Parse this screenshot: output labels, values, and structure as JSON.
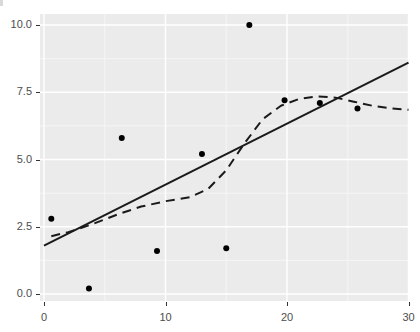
{
  "chart_data": {
    "type": "scatter",
    "title": "",
    "subtitle": "",
    "xlabel": "",
    "ylabel": "",
    "xlim": [
      -1.2,
      30.0
    ],
    "ylim": [
      -0.35,
      10.35
    ],
    "grid": true,
    "legend_position": "none",
    "x_ticks": [
      0,
      10,
      20,
      30
    ],
    "x_tick_labels": [
      "0",
      "10",
      "20",
      "30"
    ],
    "y_ticks": [
      0.0,
      2.5,
      5.0,
      7.5,
      10.0
    ],
    "y_tick_labels": [
      "0.0",
      "2.5",
      "5.0",
      "7.5",
      "10.0"
    ],
    "x_minor_ticks": [
      5,
      15,
      25
    ],
    "y_minor_ticks": [
      1.25,
      3.75,
      6.25,
      8.75
    ],
    "points": [
      {
        "x": 0.6,
        "y": 2.8
      },
      {
        "x": 3.7,
        "y": 0.2
      },
      {
        "x": 6.4,
        "y": 5.8
      },
      {
        "x": 9.3,
        "y": 1.6
      },
      {
        "x": 13.0,
        "y": 5.2
      },
      {
        "x": 15.0,
        "y": 1.7
      },
      {
        "x": 16.9,
        "y": 10.0
      },
      {
        "x": 19.8,
        "y": 7.2
      },
      {
        "x": 22.7,
        "y": 7.1
      },
      {
        "x": 25.8,
        "y": 6.9
      }
    ],
    "series": [
      {
        "name": "linear-fit",
        "style": "solid",
        "color": "#1a1a1a",
        "x": [
          0.0,
          30.0
        ],
        "values": [
          1.8,
          8.6
        ]
      },
      {
        "name": "loess-fit",
        "style": "dashed",
        "color": "#1a1a1a",
        "x": [
          0.6,
          2.0,
          4.0,
          6.0,
          8.0,
          10.0,
          12.0,
          13.5,
          15.0,
          16.5,
          18.0,
          19.5,
          21.0,
          22.5,
          24.0,
          25.5,
          27.0,
          28.5,
          30.0
        ],
        "values": [
          2.15,
          2.3,
          2.6,
          2.95,
          3.25,
          3.45,
          3.6,
          3.9,
          4.6,
          5.6,
          6.5,
          7.0,
          7.25,
          7.35,
          7.3,
          7.15,
          7.0,
          6.9,
          6.85
        ]
      }
    ],
    "colors": {
      "panel_background": "#ebebeb",
      "grid_major": "#ffffff",
      "grid_minor": "#f5f5f5",
      "point": "#000000",
      "line": "#1a1a1a",
      "tick_text": "#4d4d4d",
      "tick_mark": "#333333",
      "page_background": "#ffffff"
    },
    "geometry": {
      "panel_left": 40,
      "panel_top": 14,
      "panel_right": 409,
      "panel_bottom": 301,
      "x_px_0": 44,
      "x_px_per_unit": 12.15,
      "y_px_0": 294,
      "y_px_per_unit": 26.9,
      "point_radius": 3.0,
      "line_width": 2.0
    }
  }
}
